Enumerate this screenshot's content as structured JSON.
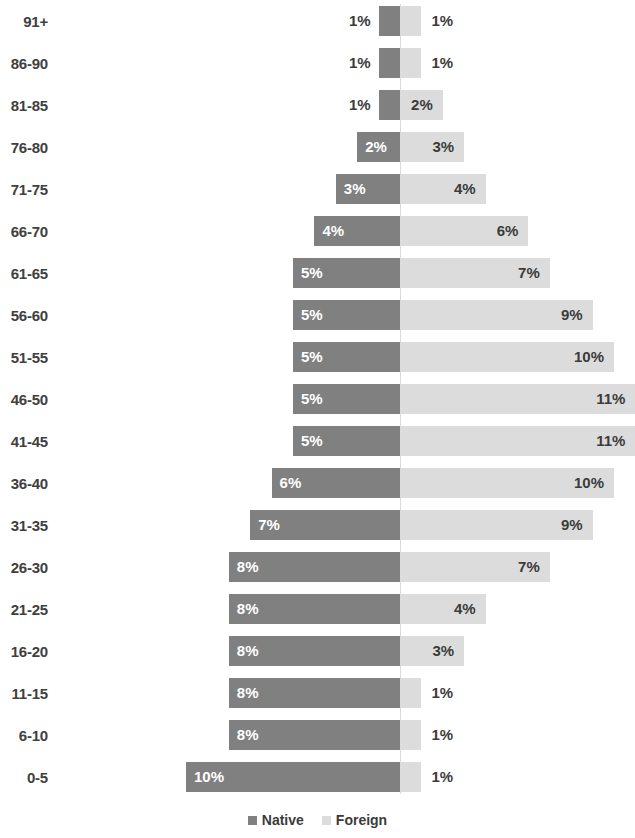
{
  "chart_data": {
    "type": "bar",
    "subtype": "population-pyramid",
    "title": "",
    "subtitle": "",
    "xlabel": "",
    "ylabel": "",
    "grid": false,
    "legend_position": "bottom-center",
    "axis_center_value": 0,
    "value_suffix": "%",
    "xlim": [
      0,
      11
    ],
    "categories": [
      "91+",
      "86-90",
      "81-85",
      "76-80",
      "71-75",
      "66-70",
      "61-65",
      "56-60",
      "51-55",
      "46-50",
      "41-45",
      "36-40",
      "31-35",
      "26-30",
      "21-25",
      "16-20",
      "11-15",
      "6-10",
      "0-5"
    ],
    "series": [
      {
        "name": "Native",
        "color": "#808080",
        "direction": "left",
        "values": [
          1,
          1,
          1,
          2,
          3,
          4,
          5,
          5,
          5,
          5,
          5,
          6,
          7,
          8,
          8,
          8,
          8,
          8,
          10
        ],
        "labels": [
          "1%",
          "1%",
          "1%",
          "2%",
          "3%",
          "4%",
          "5%",
          "5%",
          "5%",
          "5%",
          "5%",
          "6%",
          "7%",
          "8%",
          "8%",
          "8%",
          "8%",
          "8%",
          "10%"
        ]
      },
      {
        "name": "Foreign",
        "color": "#dcdcdc",
        "direction": "right",
        "values": [
          1,
          1,
          2,
          3,
          4,
          6,
          7,
          9,
          10,
          11,
          11,
          10,
          9,
          7,
          4,
          3,
          1,
          1,
          1
        ],
        "labels": [
          "1%",
          "1%",
          "2%",
          "3%",
          "4%",
          "6%",
          "7%",
          "9%",
          "10%",
          "11%",
          "11%",
          "10%",
          "9%",
          "7%",
          "4%",
          "3%",
          "1%",
          "1%",
          "1%"
        ]
      }
    ]
  },
  "legend": {
    "items": [
      {
        "label": "Native",
        "color": "#808080",
        "icon": "square-swatch-icon"
      },
      {
        "label": "Foreign",
        "color": "#dcdcdc",
        "icon": "square-swatch-icon"
      }
    ]
  },
  "layout": {
    "center_x": 400,
    "px_per_percent": 21.4,
    "row_pitch": 42,
    "row_top_offset": 0,
    "bar_height": 30,
    "label_right_edge": 48,
    "legend_y": 812,
    "axis_top": 4,
    "axis_height": 790
  }
}
